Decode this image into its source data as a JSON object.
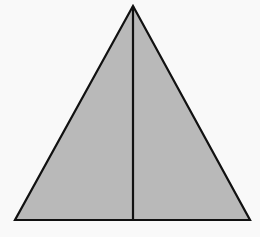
{
  "diagram": {
    "type": "isosceles-triangle-with-altitude",
    "background_color": "#f9f9f9",
    "fill_color": "#b9b9b9",
    "stroke_color": "#111111",
    "stroke_width": 2.2,
    "vertices": {
      "apex": [
        133,
        6
      ],
      "bottom_left": [
        15,
        220
      ],
      "bottom_right": [
        250,
        220
      ]
    },
    "altitude": {
      "from": [
        133,
        6
      ],
      "to": [
        133,
        220
      ]
    }
  }
}
